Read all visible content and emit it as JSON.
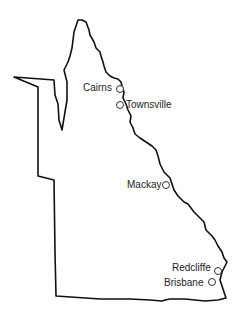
{
  "map": {
    "region": "Queensland",
    "outline_color": "#111111",
    "background": "#ffffff",
    "cities": [
      {
        "name": "Cairns",
        "label_x": 105,
        "label_y": 81,
        "marker_x": 119,
        "marker_y": 88,
        "label_side": "left"
      },
      {
        "name": "Townsville",
        "label_x": 124,
        "label_y": 100,
        "marker_x": 119,
        "marker_y": 104,
        "label_side": "right"
      },
      {
        "name": "Mackay",
        "label_x": 158,
        "label_y": 178,
        "marker_x": 165,
        "marker_y": 184,
        "label_side": "left"
      },
      {
        "name": "Redcliffe",
        "label_x": 173,
        "label_y": 261,
        "marker_x": 217,
        "marker_y": 270,
        "label_side": "left"
      },
      {
        "name": "Brisbane",
        "label_x": 165,
        "label_y": 276,
        "marker_x": 211,
        "marker_y": 281,
        "label_side": "left"
      }
    ]
  }
}
